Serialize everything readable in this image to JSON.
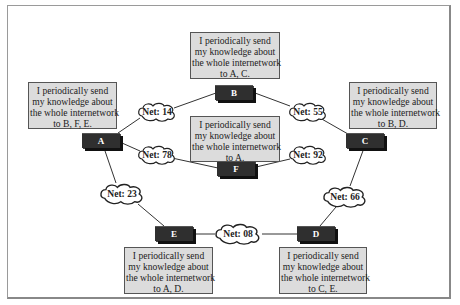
{
  "diagram": {
    "title": "",
    "routers": [
      {
        "id": "A",
        "label": "A",
        "message": [
          "I periodically send",
          "my knowledge about",
          "the whole internetwork",
          "to B, F, E."
        ]
      },
      {
        "id": "B",
        "label": "B",
        "message": [
          "I periodically send",
          "my knowledge about",
          "the whole internetwork",
          "to A, C."
        ]
      },
      {
        "id": "C",
        "label": "C",
        "message": [
          "I periodically send",
          "my knowledge about",
          "the whole internetwork",
          "to B, D."
        ]
      },
      {
        "id": "D",
        "label": "D",
        "message": [
          "I periodically send",
          "my knowledge about",
          "the whole internetwork",
          "to C, E."
        ]
      },
      {
        "id": "E",
        "label": "E",
        "message": [
          "I periodically send",
          "my knowledge about",
          "the whole internetwork",
          "to A, D."
        ]
      },
      {
        "id": "F",
        "label": "F",
        "message": [
          "I periodically send",
          "my knowledge about",
          "the whole internetwork",
          "to A."
        ]
      }
    ],
    "networks": [
      {
        "label": "Net: 14",
        "connects": [
          "A",
          "B"
        ]
      },
      {
        "label": "Net: 55",
        "connects": [
          "B",
          "C"
        ]
      },
      {
        "label": "Net: 78",
        "connects": [
          "A",
          "F"
        ]
      },
      {
        "label": "Net: 92",
        "connects": [
          "F"
        ]
      },
      {
        "label": "Net: 23",
        "connects": [
          "A",
          "E"
        ]
      },
      {
        "label": "Net: 66",
        "connects": [
          "C",
          "D"
        ]
      },
      {
        "label": "Net: 08",
        "connects": [
          "E",
          "D"
        ]
      }
    ],
    "colors": {
      "router": "#2f2f2f",
      "note_bg": "#dcdcdc",
      "line": "#333333"
    }
  }
}
